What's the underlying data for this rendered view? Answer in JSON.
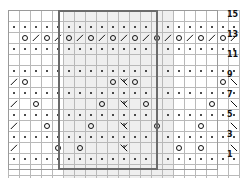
{
  "chart": {
    "columns": 21,
    "rows": 16,
    "cell_size_px": 10,
    "grid_origin": {
      "x": 8,
      "y": 10
    },
    "repeat_box": {
      "start_col": 6,
      "end_col": 15,
      "label": "pattern repeat"
    },
    "colors": {
      "grid_line": "#b9b9b9",
      "outer_frame": "#9a9a9a",
      "repeat_border": "#6b6b6b",
      "symbol": "#111111",
      "shade": "#efefef",
      "background": "#ffffff"
    },
    "row_numbers": [
      {
        "row": 15,
        "label": "15"
      },
      {
        "row": 13,
        "label": "13"
      },
      {
        "row": 11,
        "label": "11"
      },
      {
        "row": 9,
        "label": "9"
      },
      {
        "row": 7,
        "label": "7"
      },
      {
        "row": 5,
        "label": "5"
      },
      {
        "row": 3,
        "label": "3"
      },
      {
        "row": 1,
        "label": "1"
      }
    ],
    "symbol_key": {
      "blank": "knit / no stitch",
      "purl": "purl",
      "yo": "yarn over",
      "k2tog": "knit 2 together (right slant)",
      "ssk": "slip slip knit (left slant)",
      "cdd": "central double decrease"
    },
    "grid": [
      [
        "blank",
        "blank",
        "blank",
        "blank",
        "blank",
        "blank",
        "blank",
        "blank",
        "blank",
        "blank",
        "blank",
        "blank",
        "blank",
        "blank",
        "blank",
        "blank",
        "blank",
        "blank",
        "blank",
        "blank",
        "blank"
      ],
      [
        "purl",
        "purl",
        "purl",
        "purl",
        "purl",
        "purl",
        "purl",
        "purl",
        "purl",
        "purl",
        "purl",
        "purl",
        "purl",
        "purl",
        "purl",
        "purl",
        "purl",
        "purl",
        "purl",
        "purl",
        "purl"
      ],
      [
        "blank",
        "yo",
        "k2tog",
        "yo",
        "k2tog",
        "yo",
        "k2tog",
        "yo",
        "k2tog",
        "yo",
        "k2tog",
        "yo",
        "k2tog",
        "yo",
        "k2tog",
        "yo",
        "k2tog",
        "yo",
        "k2tog",
        "yo",
        "k2tog"
      ],
      [
        "purl",
        "purl",
        "purl",
        "purl",
        "purl",
        "purl",
        "purl",
        "purl",
        "purl",
        "purl",
        "purl",
        "purl",
        "purl",
        "purl",
        "purl",
        "purl",
        "purl",
        "purl",
        "purl",
        "purl",
        "purl"
      ],
      [
        "blank",
        "blank",
        "blank",
        "blank",
        "blank",
        "blank",
        "blank",
        "blank",
        "blank",
        "blank",
        "blank",
        "blank",
        "blank",
        "blank",
        "blank",
        "blank",
        "blank",
        "blank",
        "blank",
        "blank",
        "blank"
      ],
      [
        "purl",
        "purl",
        "purl",
        "purl",
        "purl",
        "purl",
        "purl",
        "purl",
        "purl",
        "purl",
        "purl",
        "purl",
        "purl",
        "purl",
        "purl",
        "purl",
        "purl",
        "purl",
        "purl",
        "purl",
        "purl"
      ],
      [
        "k2tog",
        "yo",
        "blank",
        "blank",
        "blank",
        "blank",
        "blank",
        "blank",
        "blank",
        "yo",
        "cdd",
        "yo",
        "blank",
        "blank",
        "blank",
        "blank",
        "blank",
        "blank",
        "blank",
        "yo",
        "ssk"
      ],
      [
        "purl",
        "purl",
        "purl",
        "purl",
        "purl",
        "purl",
        "purl",
        "purl",
        "purl",
        "purl",
        "purl",
        "purl",
        "purl",
        "purl",
        "purl",
        "purl",
        "purl",
        "purl",
        "purl",
        "purl",
        "purl"
      ],
      [
        "k2tog",
        "blank",
        "yo",
        "blank",
        "blank",
        "blank",
        "blank",
        "blank",
        "yo",
        "blank",
        "cdd",
        "blank",
        "yo",
        "blank",
        "blank",
        "blank",
        "blank",
        "blank",
        "yo",
        "blank",
        "ssk"
      ],
      [
        "purl",
        "purl",
        "purl",
        "purl",
        "purl",
        "purl",
        "purl",
        "purl",
        "purl",
        "purl",
        "purl",
        "purl",
        "purl",
        "purl",
        "purl",
        "purl",
        "purl",
        "purl",
        "purl",
        "purl",
        "purl"
      ],
      [
        "k2tog",
        "blank",
        "blank",
        "yo",
        "blank",
        "blank",
        "blank",
        "yo",
        "blank",
        "blank",
        "cdd",
        "blank",
        "blank",
        "yo",
        "blank",
        "blank",
        "blank",
        "yo",
        "blank",
        "blank",
        "ssk"
      ],
      [
        "purl",
        "purl",
        "purl",
        "purl",
        "purl",
        "purl",
        "purl",
        "purl",
        "purl",
        "purl",
        "purl",
        "purl",
        "purl",
        "purl",
        "purl",
        "purl",
        "purl",
        "purl",
        "purl",
        "purl",
        "purl"
      ],
      [
        "k2tog",
        "blank",
        "blank",
        "blank",
        "yo",
        "blank",
        "yo",
        "blank",
        "blank",
        "blank",
        "cdd",
        "blank",
        "blank",
        "blank",
        "blank",
        "yo",
        "blank",
        "yo",
        "blank",
        "blank",
        "ssk"
      ],
      [
        "purl",
        "purl",
        "purl",
        "purl",
        "purl",
        "purl",
        "purl",
        "purl",
        "purl",
        "purl",
        "purl",
        "purl",
        "purl",
        "purl",
        "purl",
        "purl",
        "purl",
        "purl",
        "purl",
        "purl",
        "purl"
      ],
      [
        "blank",
        "blank",
        "blank",
        "blank",
        "blank",
        "blank",
        "blank",
        "blank",
        "blank",
        "blank",
        "blank",
        "blank",
        "blank",
        "blank",
        "blank",
        "blank",
        "blank",
        "blank",
        "blank",
        "blank",
        "blank"
      ],
      [
        "blank",
        "blank",
        "blank",
        "blank",
        "blank",
        "blank",
        "blank",
        "blank",
        "blank",
        "blank",
        "blank",
        "blank",
        "blank",
        "blank",
        "blank",
        "blank",
        "blank",
        "blank",
        "blank",
        "blank",
        "blank"
      ]
    ]
  }
}
